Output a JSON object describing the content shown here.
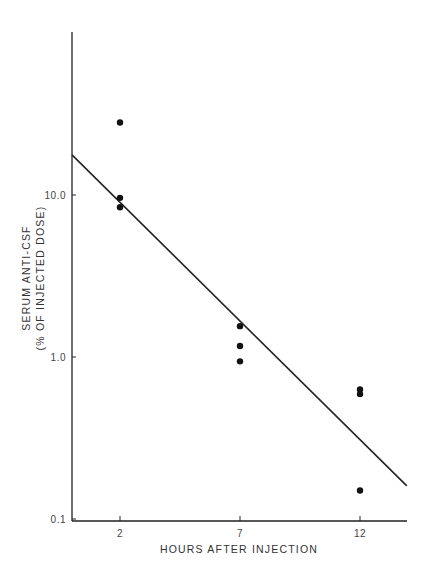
{
  "chart_data": {
    "type": "scatter",
    "title": "",
    "xlabel": "HOURS AFTER INJECTION",
    "ylabel": "SERUM ANTI-CSF",
    "ylabel_line2": "(% OF INJECTED DOSE)",
    "xscale": "linear",
    "yscale": "log",
    "xlim": [
      0,
      14
    ],
    "ylim": [
      0.1,
      100
    ],
    "x_ticks": [
      2,
      7,
      12
    ],
    "x_tick_labels": [
      "2",
      "7",
      "12"
    ],
    "y_ticks": [
      0.1,
      1.0,
      10.0
    ],
    "y_tick_labels": [
      "0.1",
      "1.0",
      "10.0"
    ],
    "grid": false,
    "legend": null,
    "series": [
      {
        "name": "measured",
        "kind": "points",
        "points": [
          {
            "x": 2,
            "y": 28
          },
          {
            "x": 2,
            "y": 9.6
          },
          {
            "x": 2,
            "y": 8.4
          },
          {
            "x": 7,
            "y": 1.55
          },
          {
            "x": 7,
            "y": 1.17
          },
          {
            "x": 7,
            "y": 0.94
          },
          {
            "x": 12,
            "y": 0.63
          },
          {
            "x": 12,
            "y": 0.59
          },
          {
            "x": 12,
            "y": 0.15
          }
        ]
      },
      {
        "name": "regression line",
        "kind": "line",
        "points": [
          {
            "x": 0,
            "y": 17.7
          },
          {
            "x": 13.95,
            "y": 0.16
          }
        ]
      }
    ]
  }
}
